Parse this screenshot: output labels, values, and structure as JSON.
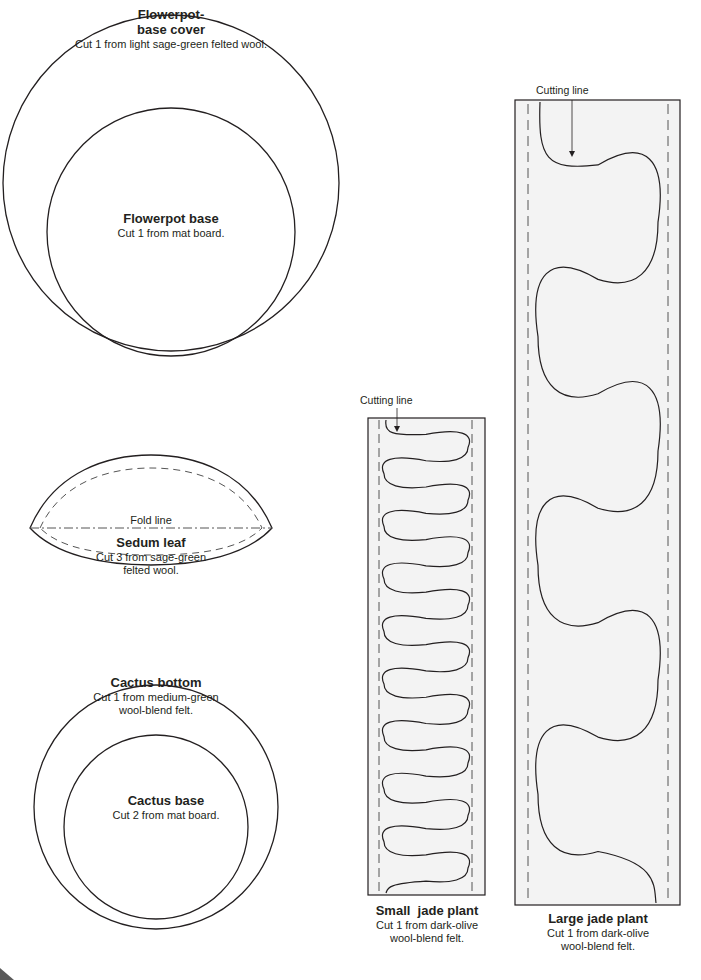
{
  "patterns": {
    "flowerpot_cover": {
      "title_line1": "Flowerpot-",
      "title_line2": "base cover",
      "instruction": "Cut 1 from light sage-green felted wool."
    },
    "flowerpot_base": {
      "title": "Flowerpot base",
      "instruction": "Cut 1 from mat board."
    },
    "sedum_leaf": {
      "fold_label": "Fold line",
      "title": "Sedum leaf",
      "instruction_line1": "Cut 3 from sage-green",
      "instruction_line2": "felted wool."
    },
    "cactus_bottom": {
      "title": "Cactus bottom",
      "instruction_line1": "Cut 1 from medium-green",
      "instruction_line2": "wool-blend felt."
    },
    "cactus_base": {
      "title": "Cactus base",
      "instruction": "Cut 2 from mat board."
    },
    "small_jade": {
      "cutting_label": "Cutting line",
      "title": "Small  jade plant",
      "instruction_line1": "Cut 1 from dark-olive",
      "instruction_line2": "wool-blend felt.",
      "loops": 18
    },
    "large_jade": {
      "cutting_label": "Cutting line",
      "title": "Large jade plant",
      "instruction_line1": "Cut 1 from dark-olive",
      "instruction_line2": "wool-blend felt.",
      "loops": 7
    }
  },
  "colors": {
    "line": "#231f20",
    "dash": "#555555",
    "strip_fill": "#f3f3f3"
  }
}
